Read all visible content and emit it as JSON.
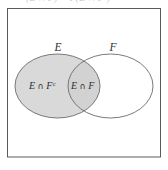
{
  "figure": {
    "type": "venn-diagram",
    "caption_fragment_top": "(E ∩ F) + P(E ∩ Fᶜ)",
    "universe": {
      "label": "",
      "border_color": "#5a5a5a",
      "fill_color": "#ffffff"
    },
    "sets": [
      {
        "id": "E",
        "label": "E",
        "shaded": true,
        "fill_color": "#d9d9d9",
        "stroke_color": "#6b6b6b"
      },
      {
        "id": "F",
        "label": "F",
        "shaded": false,
        "fill_color": "#ffffff",
        "stroke_color": "#6b6b6b"
      }
    ],
    "regions": [
      {
        "id": "E-minus-F",
        "label_main": "E",
        "label_operator": "∩",
        "label_second": "F",
        "label_superscript": "c",
        "label_full": "E ∩ Fᶜ",
        "shaded": true
      },
      {
        "id": "E-and-F",
        "label_main": "E",
        "label_operator": "∩",
        "label_second": "F",
        "label_superscript": "",
        "label_full": "E ∩ F",
        "shaded": true
      }
    ],
    "colors": {
      "shade": "#d9d9d9",
      "overlap_shade": "#d2d2d2",
      "outline": "#6b6b6b",
      "box_outline": "#5a5a5a",
      "text": "#2e2e2e",
      "background": "#ffffff"
    }
  }
}
